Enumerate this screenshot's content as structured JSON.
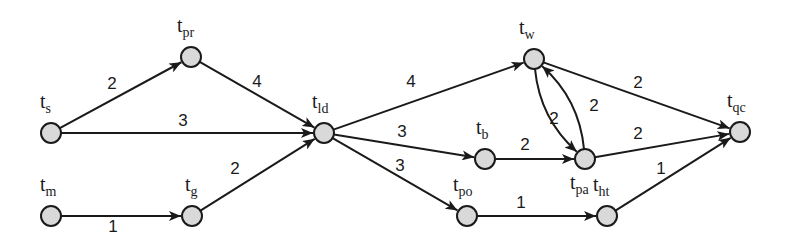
{
  "diagram": {
    "type": "directed-weighted-graph",
    "nodes": [
      {
        "id": "ts",
        "base": "t",
        "sub": "s",
        "x": 51,
        "y": 133,
        "lx": 40,
        "ly": 108
      },
      {
        "id": "tpr",
        "base": "t",
        "sub": "pr",
        "x": 191,
        "y": 57,
        "lx": 177,
        "ly": 32
      },
      {
        "id": "tld",
        "base": "t",
        "sub": "ld",
        "x": 324,
        "y": 133,
        "lx": 312,
        "ly": 108
      },
      {
        "id": "tm",
        "base": "t",
        "sub": "m",
        "x": 51,
        "y": 216,
        "lx": 40,
        "ly": 191
      },
      {
        "id": "tg",
        "base": "t",
        "sub": "g",
        "x": 192,
        "y": 216,
        "lx": 185,
        "ly": 191
      },
      {
        "id": "tw",
        "base": "t",
        "sub": "w",
        "x": 534,
        "y": 59,
        "lx": 519,
        "ly": 34
      },
      {
        "id": "tb",
        "base": "t",
        "sub": "b",
        "x": 485,
        "y": 159,
        "lx": 476,
        "ly": 134
      },
      {
        "id": "tpa",
        "base": "t",
        "sub": "pa",
        "x": 585,
        "y": 159,
        "lx": 570,
        "ly": 189
      },
      {
        "id": "tpo",
        "base": "t",
        "sub": "po",
        "x": 467,
        "y": 216,
        "lx": 453,
        "ly": 191
      },
      {
        "id": "tht",
        "base": "t",
        "sub": "ht",
        "x": 607,
        "y": 216,
        "lx": 593,
        "ly": 191
      },
      {
        "id": "tqc",
        "base": "t",
        "sub": "qc",
        "x": 740,
        "y": 132,
        "lx": 727,
        "ly": 107
      }
    ],
    "edges": [
      {
        "from": "ts",
        "to": "tpr",
        "weight": "2",
        "wx": 112,
        "wy": 89
      },
      {
        "from": "ts",
        "to": "tld",
        "weight": "3",
        "wx": 183,
        "wy": 126
      },
      {
        "from": "tpr",
        "to": "tld",
        "weight": "4",
        "wx": 257,
        "wy": 87
      },
      {
        "from": "tm",
        "to": "tg",
        "weight": "1",
        "wx": 113,
        "wy": 232
      },
      {
        "from": "tg",
        "to": "tld",
        "weight": "2",
        "wx": 235,
        "wy": 174
      },
      {
        "from": "tld",
        "to": "tw",
        "weight": "4",
        "wx": 411,
        "wy": 87
      },
      {
        "from": "tld",
        "to": "tb",
        "weight": "3",
        "wx": 402,
        "wy": 137
      },
      {
        "from": "tld",
        "to": "tpo",
        "weight": "3",
        "wx": 400,
        "wy": 171
      },
      {
        "from": "tb",
        "to": "tpa",
        "weight": "2",
        "wx": 525,
        "wy": 150
      },
      {
        "from": "tw",
        "to": "tpa",
        "weight": "2",
        "wx": 594,
        "wy": 111,
        "curved": true
      },
      {
        "from": "tpa",
        "to": "tw",
        "weight": "2",
        "wx": 554,
        "wy": 124,
        "curved": true
      },
      {
        "from": "tw",
        "to": "tqc",
        "weight": "2",
        "wx": 638,
        "wy": 88
      },
      {
        "from": "tpa",
        "to": "tqc",
        "weight": "2",
        "wx": 638,
        "wy": 139
      },
      {
        "from": "tpo",
        "to": "tht",
        "weight": "1",
        "wx": 521,
        "wy": 208
      },
      {
        "from": "tht",
        "to": "tqc",
        "weight": "1",
        "wx": 661,
        "wy": 174
      }
    ]
  }
}
